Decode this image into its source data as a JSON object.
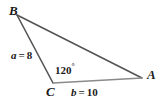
{
  "figure": {
    "type": "triangle-diagram",
    "background_color": "#ffffff",
    "stroke_color": "#555555",
    "stroke_color_light": "#8a8a8a",
    "text_color": "#1a1a1a",
    "vertices": [
      {
        "name": "B",
        "label": "B",
        "x": 17,
        "y": 15
      },
      {
        "name": "C",
        "label": "C",
        "x": 53,
        "y": 83
      },
      {
        "name": "A",
        "label": "A",
        "x": 142,
        "y": 78
      }
    ],
    "sides": [
      {
        "name": "side-a",
        "variable": "a",
        "equals": "=",
        "value": "8",
        "label": "a = 8",
        "from": "B",
        "to": "C"
      },
      {
        "name": "side-b",
        "variable": "b",
        "equals": "=",
        "value": "10",
        "label": "b = 10",
        "from": "C",
        "to": "A"
      },
      {
        "name": "side-c",
        "variable": "c",
        "equals": "",
        "value": "",
        "label": "",
        "from": "B",
        "to": "A"
      }
    ],
    "angles": [
      {
        "at": "C",
        "value": "120",
        "degree_symbol": "°",
        "label": "120°"
      }
    ]
  }
}
